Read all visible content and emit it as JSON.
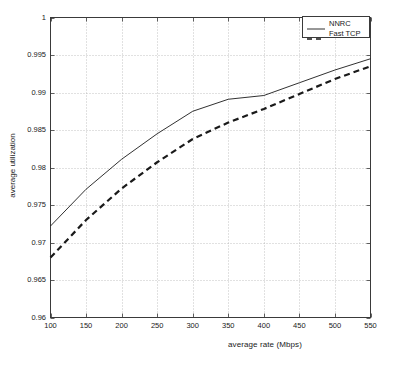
{
  "chart_data": {
    "type": "line",
    "title": "",
    "xlabel": "average rate (Mbps)",
    "ylabel": "average utilization",
    "xlim": [
      100,
      550
    ],
    "ylim": [
      0.96,
      1
    ],
    "xticks": [
      100,
      150,
      200,
      250,
      300,
      350,
      400,
      450,
      500,
      550
    ],
    "yticks": [
      0.96,
      0.965,
      0.97,
      0.975,
      0.98,
      0.985,
      0.99,
      0.995,
      1
    ],
    "xtick_labels": [
      "100",
      "150",
      "200",
      "250",
      "300",
      "350",
      "400",
      "450",
      "500",
      "550"
    ],
    "ytick_labels": [
      "0.96",
      "0.965",
      "0.97",
      "0.975",
      "0.98",
      "0.985",
      "0.99",
      "0.995",
      "1"
    ],
    "grid": true,
    "grid_style": "dotted",
    "legend_position": "top-right",
    "x": [
      100,
      150,
      200,
      250,
      300,
      350,
      400,
      450,
      500,
      550
    ],
    "series": [
      {
        "name": "NNRC",
        "style": "solid",
        "color": "#1a1a1a",
        "values": [
          0.9722,
          0.9771,
          0.9811,
          0.9845,
          0.9875,
          0.9891,
          0.9896,
          0.9913,
          0.993,
          0.9945
        ]
      },
      {
        "name": "Fast TCP",
        "style": "dashed",
        "color": "#1a1a1a",
        "values": [
          0.968,
          0.973,
          0.9772,
          0.9807,
          0.9838,
          0.986,
          0.9878,
          0.9898,
          0.9918,
          0.9935
        ]
      }
    ]
  },
  "legend": {
    "entries": [
      {
        "label": "NNRC"
      },
      {
        "label": "Fast TCP"
      }
    ]
  },
  "axes": {
    "x_axis_label": "average rate (Mbps)",
    "y_axis_label": "average utilization"
  }
}
